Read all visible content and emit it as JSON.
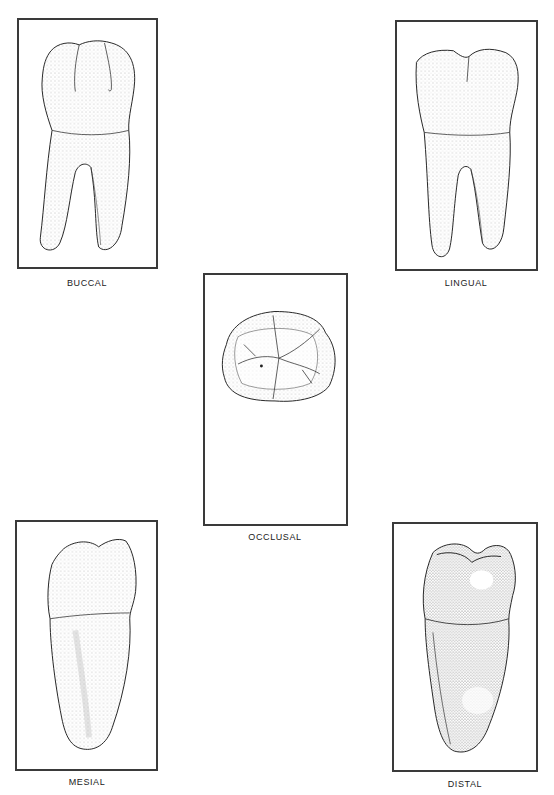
{
  "plate": {
    "views": [
      {
        "id": "buccal",
        "label": "BUCCAL"
      },
      {
        "id": "lingual",
        "label": "LINGUAL"
      },
      {
        "id": "occlusal",
        "label": "OCCLUSAL"
      },
      {
        "id": "mesial",
        "label": "MESIAL"
      },
      {
        "id": "distal",
        "label": "DISTAL"
      }
    ]
  }
}
